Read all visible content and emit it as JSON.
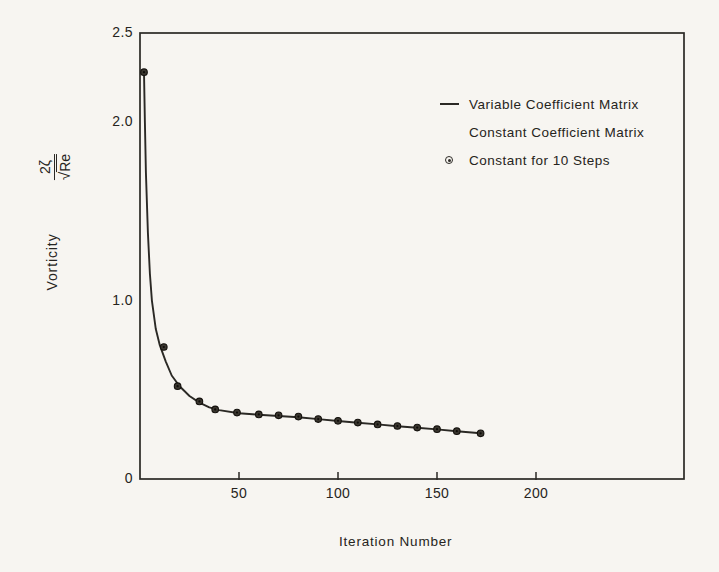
{
  "chart_data": {
    "type": "line",
    "title": "",
    "xlabel": "Iteration Number",
    "ylabel": "Vorticity",
    "ylabel_formula": {
      "numerator": "2ζ",
      "radical": "√",
      "denominator": "Re"
    },
    "xlim": [
      0,
      275
    ],
    "ylim": [
      0,
      2.5
    ],
    "grid": false,
    "legend_position": "upper-right-inside",
    "x_ticks": [
      50,
      100,
      150,
      200
    ],
    "x_tick_labels": [
      "50",
      "100",
      "150",
      "200"
    ],
    "y_ticks": [
      2.5,
      2.0,
      1.0,
      0
    ],
    "y_tick_labels": [
      "2.5",
      "2.0",
      "1.0",
      "0"
    ],
    "legend": [
      {
        "symbol": "line",
        "label": "Variable Coefficient Matrix"
      },
      {
        "symbol": "none",
        "label": "Constant Coefficient Matrix"
      },
      {
        "symbol": "circle-marker",
        "label": "Constant for 10 Steps"
      }
    ],
    "series": [
      {
        "name": "Variable Coefficient Matrix",
        "type": "line",
        "points": [
          [
            2,
            2.28
          ],
          [
            2.5,
            2.0
          ],
          [
            3,
            1.72
          ],
          [
            4,
            1.38
          ],
          [
            5,
            1.15
          ],
          [
            6,
            1.0
          ],
          [
            8,
            0.84
          ],
          [
            10,
            0.75
          ],
          [
            13,
            0.66
          ],
          [
            16,
            0.58
          ],
          [
            20,
            0.52
          ],
          [
            25,
            0.465
          ],
          [
            30,
            0.428
          ],
          [
            35,
            0.402
          ],
          [
            40,
            0.386
          ],
          [
            50,
            0.369
          ],
          [
            60,
            0.36
          ],
          [
            70,
            0.353
          ],
          [
            80,
            0.346
          ],
          [
            90,
            0.336
          ],
          [
            100,
            0.325
          ],
          [
            110,
            0.315
          ],
          [
            120,
            0.306
          ],
          [
            130,
            0.296
          ],
          [
            140,
            0.287
          ],
          [
            150,
            0.278
          ],
          [
            160,
            0.268
          ],
          [
            172,
            0.256
          ]
        ]
      },
      {
        "name": "Constant for 10 Steps",
        "type": "scatter",
        "points": [
          [
            2,
            2.28
          ],
          [
            12,
            0.74
          ],
          [
            19,
            0.52
          ],
          [
            30,
            0.435
          ],
          [
            38,
            0.39
          ],
          [
            49,
            0.372
          ],
          [
            60,
            0.362
          ],
          [
            70,
            0.357
          ],
          [
            80,
            0.35
          ],
          [
            90,
            0.336
          ],
          [
            100,
            0.326
          ],
          [
            110,
            0.316
          ],
          [
            120,
            0.306
          ],
          [
            130,
            0.297
          ],
          [
            140,
            0.288
          ],
          [
            150,
            0.279
          ],
          [
            160,
            0.268
          ],
          [
            172,
            0.256
          ]
        ]
      }
    ],
    "colors": {
      "ink": "#2b2925",
      "background": "#f7f5f1"
    }
  }
}
